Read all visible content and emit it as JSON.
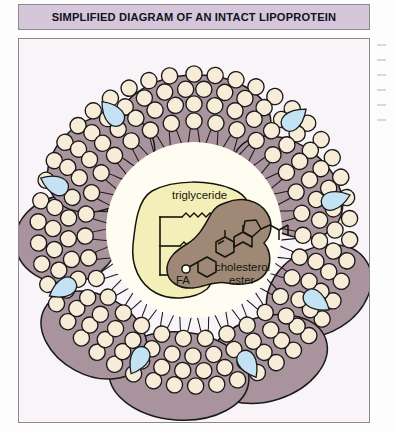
{
  "figure": {
    "title": "SIMPLIFIED DIAGRAM OF AN INTACT LIPOPROTEIN",
    "labels": {
      "triglyceride": "triglyceride",
      "cholesterol_line1": "cholesterol",
      "cholesterol_line2": "ester",
      "fatty_acid": "FA"
    },
    "colors": {
      "title_band": "#d5c6da",
      "title_text": "#12121e",
      "panel_background": "#f8f4f8",
      "panel_border": "#8e8792",
      "phospholipid_head": "#f6ecd8",
      "phospholipid_head_stroke": "#1a1a1a",
      "apolipoprotein": "#a9939c",
      "apolipoprotein_stroke": "#1a1a1a",
      "cholesterol": "#c3e2f3",
      "cholesterol_stroke": "#1a1a1a",
      "core_background": "#fffdf2",
      "triglyceride_fill": "#f4efb9",
      "cholesterol_ester_fill": "#9f8976",
      "molecule_stroke": "#14140c",
      "label_text": "#14140c"
    },
    "components": [
      {
        "name": "phospholipid-monolayer",
        "description": "ring of circular polar head groups with inward hydrocarbon tails"
      },
      {
        "name": "apolipoprotein",
        "description": "mauve lobes embedded in and protruding from the surface"
      },
      {
        "name": "free-cholesterol",
        "description": "light blue wedge shapes inserted in the monolayer"
      },
      {
        "name": "triglyceride",
        "description": "pale yellow core blob with glycerol backbone and three fatty acid chains"
      },
      {
        "name": "cholesterol-ester",
        "description": "brown core blob with fused steroid rings and esterified fatty acid"
      }
    ],
    "counts": {
      "apolipoprotein_lobes": 8,
      "cholesterol_wedges": 8,
      "triglyceride_fatty_acid_chains": 3,
      "steroid_rings": 4
    }
  }
}
